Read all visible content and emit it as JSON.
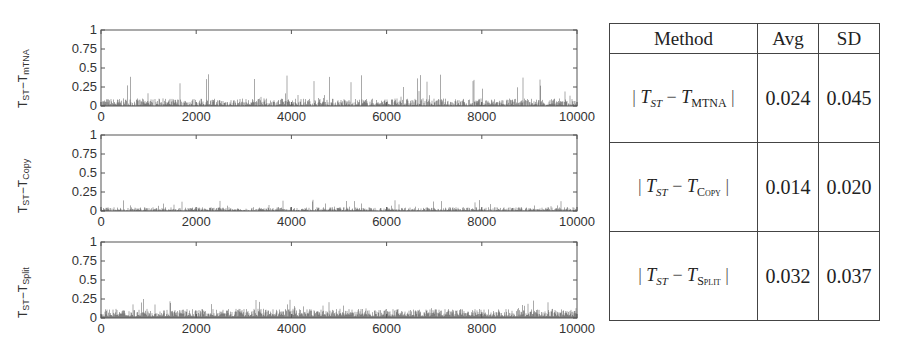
{
  "chart_data": [
    {
      "type": "bar",
      "title": "",
      "ylabel": "T_ST - T_mTNA",
      "ylabel_main": "T",
      "ylabel_sub1": "ST",
      "ylabel_sub2": "mTNA",
      "xlabel": "",
      "xlim": [
        0,
        10000
      ],
      "ylim": [
        0,
        1
      ],
      "xticks": [
        "0",
        "2000",
        "4000",
        "6000",
        "8000",
        "10000"
      ],
      "yticks": [
        "0",
        "0.25",
        "0.5",
        "0.75",
        "1"
      ],
      "typical_range": [
        0,
        0.1
      ],
      "max_spike": 0.42,
      "grid": false
    },
    {
      "type": "bar",
      "title": "",
      "ylabel": "T_ST - T_Copy",
      "ylabel_main": "T",
      "ylabel_sub1": "ST",
      "ylabel_sub2": "Copy",
      "xlabel": "",
      "xlim": [
        0,
        10000
      ],
      "ylim": [
        0,
        1
      ],
      "xticks": [
        "0",
        "2000",
        "4000",
        "6000",
        "8000",
        "10000"
      ],
      "yticks": [
        "0",
        "0.25",
        "0.5",
        "0.75",
        "1"
      ],
      "typical_range": [
        0,
        0.05
      ],
      "max_spike": 0.15,
      "grid": false
    },
    {
      "type": "bar",
      "title": "",
      "ylabel": "T_ST - T_Split",
      "ylabel_main": "T",
      "ylabel_sub1": "ST",
      "ylabel_sub2": "Split",
      "xlabel": "",
      "xlim": [
        0,
        10000
      ],
      "ylim": [
        0,
        1
      ],
      "xticks": [
        "0",
        "2000",
        "4000",
        "6000",
        "8000",
        "10000"
      ],
      "yticks": [
        "0",
        "0.25",
        "0.5",
        "0.75",
        "1"
      ],
      "typical_range": [
        0.02,
        0.12
      ],
      "max_spike": 0.25,
      "grid": false
    },
    {
      "type": "table",
      "columns": [
        "Method",
        "Avg",
        "SD"
      ],
      "rows": [
        {
          "method_sub": "MTNA",
          "avg": "0.024",
          "sd": "0.045"
        },
        {
          "method_sub": "Copy",
          "avg": "0.014",
          "sd": "0.020"
        },
        {
          "method_sub": "Split",
          "avg": "0.032",
          "sd": "0.037"
        }
      ]
    }
  ],
  "table": {
    "headers": {
      "method": "Method",
      "avg": "Avg",
      "sd": "SD"
    },
    "rows": [
      {
        "t": "T",
        "st": "ST",
        "minus": "−",
        "sub": "MTNA",
        "avg": "0.024",
        "sd": "0.045"
      },
      {
        "t": "T",
        "st": "ST",
        "minus": "−",
        "sub": "Copy",
        "avg": "0.014",
        "sd": "0.020"
      },
      {
        "t": "T",
        "st": "ST",
        "minus": "−",
        "sub": "Split",
        "avg": "0.032",
        "sd": "0.037"
      }
    ]
  }
}
